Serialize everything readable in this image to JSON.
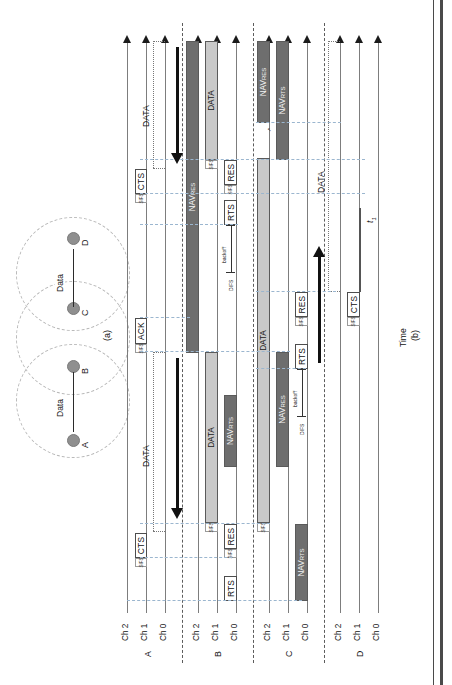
{
  "figure": {
    "part_a": {
      "label": "(a)",
      "nodes": [
        {
          "id": "A",
          "label": "A"
        },
        {
          "id": "B",
          "label": "B"
        },
        {
          "id": "C",
          "label": "C"
        },
        {
          "id": "D",
          "label": "D"
        }
      ],
      "flows": [
        {
          "label": "Data",
          "from": "B",
          "to": "A"
        },
        {
          "label": "Data",
          "from": "C",
          "to": "D"
        }
      ],
      "circle_count": 3
    },
    "part_b": {
      "label": "(b)",
      "time_axis_label": "Time",
      "time_marker": "t",
      "time_marker_sub": "1",
      "channel_labels": [
        "Ch 2",
        "Ch 1",
        "Ch 0"
      ],
      "node_labels": [
        "A",
        "B",
        "C",
        "D"
      ],
      "sifs_label": "SIFS",
      "difs_label": "DIFS",
      "backoff_label": "backoff",
      "rows": [
        {
          "node": "A",
          "channels": [
            {
              "name": "Ch 2",
              "items": []
            },
            {
              "name": "Ch 1",
              "items": [
                {
                  "type": "frame",
                  "label": "CTS"
                },
                {
                  "type": "frame",
                  "label": "ACK"
                },
                {
                  "type": "frame",
                  "label": "CTS"
                }
              ]
            },
            {
              "name": "Ch 0",
              "items": [
                {
                  "type": "dotted",
                  "label": "DATA"
                },
                {
                  "type": "dotted",
                  "label": "DATA"
                }
              ]
            }
          ]
        },
        {
          "node": "B",
          "channels": [
            {
              "name": "Ch 2",
              "items": [
                {
                  "type": "bar-dark",
                  "label": "NAV",
                  "sub": "RES"
                }
              ]
            },
            {
              "name": "Ch 1",
              "items": [
                {
                  "type": "bar-light",
                  "label": "DATA"
                },
                {
                  "type": "bar-light",
                  "label": "DATA"
                }
              ]
            },
            {
              "name": "Ch 0",
              "items": [
                {
                  "type": "frame",
                  "label": "RTS"
                },
                {
                  "type": "frame",
                  "label": "RES"
                },
                {
                  "type": "bar-dark",
                  "label": "NAV",
                  "sub": "RTS"
                },
                {
                  "type": "frame",
                  "label": "RTS"
                },
                {
                  "type": "frame",
                  "label": "RES"
                }
              ]
            }
          ]
        },
        {
          "node": "C",
          "channels": [
            {
              "name": "Ch 2",
              "items": [
                {
                  "type": "bar-light",
                  "label": "DATA"
                },
                {
                  "type": "bar-dark",
                  "label": "NAV",
                  "sub": "RES"
                }
              ]
            },
            {
              "name": "Ch 1",
              "items": [
                {
                  "type": "bar-dark",
                  "label": "NAV",
                  "sub": "RES"
                },
                {
                  "type": "bar-dark",
                  "label": "NAV",
                  "sub": "RTS"
                }
              ]
            },
            {
              "name": "Ch 0",
              "items": [
                {
                  "type": "bar-dark",
                  "label": "NAV",
                  "sub": "RTS"
                },
                {
                  "type": "frame",
                  "label": "RTS"
                },
                {
                  "type": "frame",
                  "label": "RES"
                }
              ]
            }
          ]
        },
        {
          "node": "D",
          "channels": [
            {
              "name": "Ch 2",
              "items": [
                {
                  "type": "dotted",
                  "label": "DATA"
                }
              ]
            },
            {
              "name": "Ch 1",
              "items": [
                {
                  "type": "frame",
                  "label": "CTS"
                }
              ]
            },
            {
              "name": "Ch 0",
              "items": []
            }
          ]
        }
      ]
    }
  },
  "labels": {
    "nav": "NAV",
    "nav_res_sub": "RES",
    "nav_rts_sub": "RTS",
    "data": "DATA",
    "rts": "RTS",
    "cts": "CTS",
    "res": "RES",
    "ack": "ACK",
    "sifs": "SIFS",
    "difs": "DIFS",
    "backoff": "backoff",
    "time": "Time",
    "ch2": "Ch 2",
    "ch1": "Ch 1",
    "ch0": "Ch 0",
    "node_a": "A",
    "node_b": "B",
    "node_c": "C",
    "node_d": "D",
    "part_a": "(a)",
    "part_b": "(b)",
    "t1": "t",
    "t1_sub": "1"
  },
  "colors": {
    "nav_bar": "#6e6e6e",
    "data_bar": "#c9c9c9",
    "frame_border": "#4d4d4d",
    "axis": "#7d7d7d",
    "guide": "#9bb6cf",
    "separator": "#5c5c5c"
  }
}
